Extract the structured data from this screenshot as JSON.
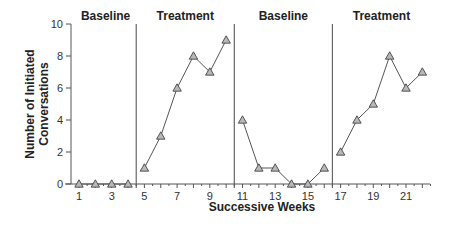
{
  "chart_data": {
    "type": "line",
    "title": "",
    "xlabel": "Successive Weeks",
    "ylabel": "Number of Initiated Conversations",
    "ylabel_lines": [
      "Number of Initiated",
      "Conversations"
    ],
    "ylim": [
      0,
      10
    ],
    "yticks": [
      0,
      2,
      4,
      6,
      8,
      10
    ],
    "xlim": [
      0.5,
      22.5
    ],
    "xtick_labels": [
      1,
      3,
      5,
      7,
      9,
      11,
      13,
      15,
      17,
      19,
      21
    ],
    "grid": false,
    "legend": null,
    "marker": "triangle",
    "phase_change_lines_after_week": [
      4.5,
      10.5,
      16.5
    ],
    "phases": [
      {
        "name": "Baseline",
        "x": [
          1,
          2,
          3,
          4
        ],
        "values": [
          0,
          0,
          0,
          0
        ]
      },
      {
        "name": "Treatment",
        "x": [
          5,
          6,
          7,
          8,
          9,
          10
        ],
        "values": [
          1,
          3,
          6,
          8,
          7,
          9
        ]
      },
      {
        "name": "Baseline",
        "x": [
          11,
          12,
          13,
          14,
          15,
          16
        ],
        "values": [
          4,
          1,
          1,
          0,
          0,
          1
        ]
      },
      {
        "name": "Treatment",
        "x": [
          17,
          18,
          19,
          20,
          21,
          22
        ],
        "values": [
          2,
          4,
          5,
          8,
          6,
          7
        ]
      }
    ]
  },
  "colors": {
    "line": "#555555",
    "marker_fill": "#b8b8b8",
    "marker_stroke": "#444444",
    "axis": "#555555",
    "phase_line": "#666666"
  }
}
